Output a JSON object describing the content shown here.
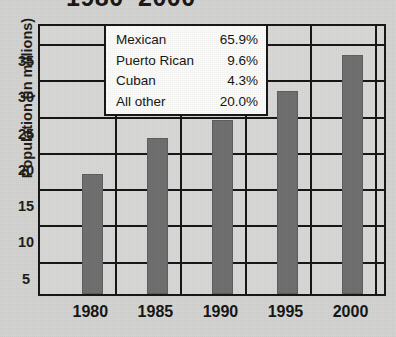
{
  "chart_data": {
    "type": "bar",
    "title": "1980–2000",
    "xlabel": "",
    "ylabel": "Population (in millions)",
    "categories": [
      "1980",
      "1985",
      "1990",
      "1995",
      "2000"
    ],
    "values": [
      16.5,
      21.5,
      24,
      28,
      33
    ],
    "ylim": [
      0,
      37.5
    ],
    "yticks": [
      5,
      10,
      15,
      20,
      25,
      30,
      35
    ],
    "grid": true,
    "legend_position": "inside-top-left",
    "bar_color": "#6e6e6e",
    "annotations": {
      "breakdown_title": "",
      "rows": [
        {
          "label": "Mexican",
          "value": "65.9%"
        },
        {
          "label": "Puerto Rican",
          "value": "9.6%"
        },
        {
          "label": "Cuban",
          "value": "4.3%"
        },
        {
          "label": "All other",
          "value": "20.0%"
        }
      ]
    }
  }
}
